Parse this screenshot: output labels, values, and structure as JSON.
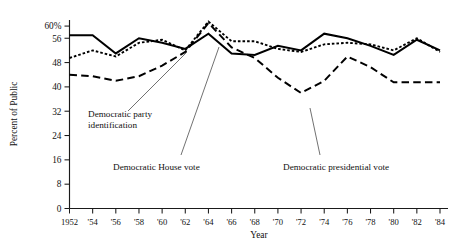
{
  "chart_data": {
    "type": "line",
    "title": "",
    "xlabel": "Year",
    "ylabel": "Percent of Public",
    "ylim": [
      0,
      62
    ],
    "yticks": [
      0,
      8,
      16,
      24,
      32,
      40,
      48,
      56,
      60
    ],
    "ytick_labels": [
      "0",
      "8",
      "16",
      "24",
      "32",
      "40",
      "48",
      "56",
      "60%"
    ],
    "grid": false,
    "legend": "annotations",
    "x": [
      1952,
      1954,
      1956,
      1958,
      1960,
      1962,
      1964,
      1966,
      1968,
      1970,
      1972,
      1974,
      1976,
      1978,
      1980,
      1982,
      1984
    ],
    "xtick_labels": [
      "1952",
      "'54",
      "'56",
      "'58",
      "'60",
      "'62",
      "'64",
      "'66",
      "'68",
      "'70",
      "'72",
      "'74",
      "'76",
      "'78",
      "'80",
      "'82",
      "'84"
    ],
    "series": [
      {
        "name": "Democratic House vote",
        "style": "solid",
        "values": [
          57.0,
          57.0,
          51.0,
          56.0,
          54.5,
          52.5,
          57.5,
          51.0,
          50.5,
          53.5,
          52.0,
          57.5,
          56.0,
          53.5,
          50.5,
          55.5,
          52.0
        ]
      },
      {
        "name": "Democratic party identification",
        "style": "dotted",
        "values": [
          49.5,
          52.0,
          50.0,
          54.5,
          55.5,
          52.0,
          61.5,
          55.0,
          55.0,
          52.5,
          51.5,
          54.0,
          54.5,
          54.0,
          52.0,
          56.0,
          51.5
        ]
      },
      {
        "name": "Democratic presidential vote",
        "style": "dashed",
        "values": [
          44.0,
          43.5,
          42.0,
          43.5,
          47.0,
          51.5,
          61.0,
          53.0,
          49.5,
          43.0,
          38.0,
          42.0,
          50.0,
          46.5,
          41.5,
          41.5,
          41.5
        ]
      }
    ],
    "annotations": [
      {
        "id": "party-identification",
        "label_line1": "Democratic party",
        "label_line2": "identification",
        "target_x": 1962,
        "target_series": "Democratic party identification"
      },
      {
        "id": "house-vote",
        "label_line1": "Democratic House vote",
        "label_line2": "",
        "target_x": 1966,
        "target_series": "Democratic House vote"
      },
      {
        "id": "presidential-vote",
        "label_line1": "Democratic presidential vote",
        "label_line2": "",
        "target_x": 1974,
        "target_series": "Democratic presidential vote"
      }
    ]
  },
  "colors": {
    "ink": "#111111",
    "background": "#ffffff"
  }
}
